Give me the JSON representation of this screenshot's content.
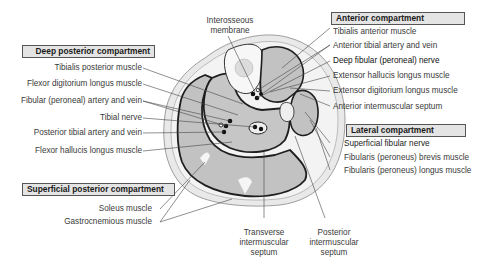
{
  "figure": {
    "compartments": {
      "deep_posterior": "Deep posterior compartment",
      "anterior": "Anterior compartment",
      "lateral": "Lateral compartment",
      "superficial_posterior": "Superficial posterior compartment"
    },
    "left_labels": {
      "tibialis_posterior": "Tibialis posterior muscle",
      "flexor_digitorum": "Flexor digitorium longus muscle",
      "fibular_artery": "Fibular (peroneal) artery and vein",
      "tibial_nerve": "Tibial nerve",
      "posterior_tibial": "Posterior tibial artery and vein",
      "flexor_hallucis": "Flexor hallucis longus muscle",
      "soleus": "Soleus muscle",
      "gastrocnemius": "Gastrocnemious muscle"
    },
    "right_labels": {
      "tibialis_anterior": "Tibialis anterior muscle",
      "anterior_tibial": "Anterior tibial artery and vein",
      "deep_fibular": "Deep fibular (peroneal) nerve",
      "ext_hallucis": "Extensor hallucis longus muscle",
      "ext_digitorum": "Extensor digitorium longus muscle",
      "ant_septum": "Anterior intermuscular septum",
      "superficial_fibular": "Superficial fibular nerve",
      "fib_brevis": "Fibularis (peroneus) brevis muscle",
      "fib_longus": "Fibularis (peroneus) longus muscle"
    },
    "top_labels": {
      "interosseous_1": "Interosseous",
      "interosseous_2": "membrane"
    },
    "bottom_labels": {
      "transverse_1": "Transverse",
      "transverse_2": "intermuscular",
      "transverse_3": "septum",
      "posterior_1": "Posterior",
      "posterior_2": "intermuscular",
      "posterior_3": "septum"
    },
    "colors": {
      "skin": "#e6e6e6",
      "fat": "#f2f2f2",
      "muscle": "#bdbdbd",
      "fascia": "#222222",
      "box_fill": "#e4e4e4"
    }
  }
}
